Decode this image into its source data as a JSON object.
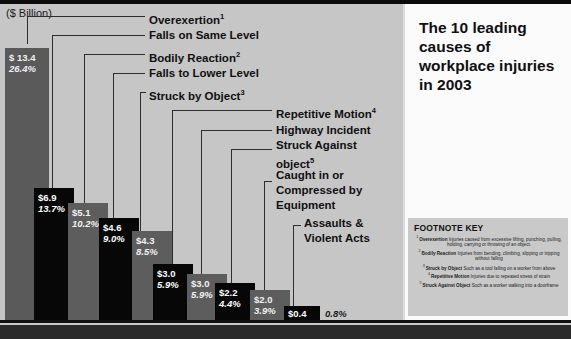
{
  "header": {
    "title": "The 10 leading causes of workplace injuries in 2003",
    "axis_unit": "($ Billion)"
  },
  "chart_data": {
    "type": "bar",
    "title": "The 10 leading causes of workplace injuries in 2003",
    "xlabel": "",
    "ylabel": "($ Billion)",
    "ylim": [
      0,
      13.4
    ],
    "grid": false,
    "legend": "none",
    "categories": [
      "Overexertion",
      "Falls on Same Level",
      "Bodily Reaction",
      "Falls to Lower Level",
      "Struck by Object",
      "Repetitive Motion",
      "Highway Incident",
      "Struck Against object",
      "Caught in or Compressed by Equipment",
      "Assaults & Violent Acts"
    ],
    "values": [
      13.4,
      6.9,
      5.1,
      4.6,
      4.3,
      3.0,
      3.0,
      2.2,
      2.0,
      0.4
    ],
    "value_labels": [
      "$ 13.4",
      "$6.9",
      "$5.1",
      "$4.6",
      "$4.3",
      "$3.0",
      "$3.0",
      "$2.2",
      "$2.0",
      "$0.4"
    ],
    "percents": [
      26.4,
      13.7,
      10.2,
      9.0,
      8.5,
      5.9,
      5.9,
      4.4,
      3.9,
      0.8
    ],
    "percent_labels": [
      "26.4%",
      "13.7%",
      "10.2%",
      "9.0%",
      "8.5%",
      "5.9%",
      "5.9%",
      "4.4%",
      "3.9%",
      "0.8%"
    ],
    "footnote_markers": [
      "1",
      "",
      "2",
      "",
      "3",
      "4",
      "",
      "5",
      "",
      ""
    ]
  },
  "bars": [
    {
      "value_label": "$ 13.4",
      "percent_label": "26.4%",
      "category": "Overexertion",
      "marker": "1"
    },
    {
      "value_label": "$6.9",
      "percent_label": "13.7%",
      "category": "Falls on Same Level",
      "marker": ""
    },
    {
      "value_label": "$5.1",
      "percent_label": "10.2%",
      "category": "Bodily Reaction",
      "marker": "2"
    },
    {
      "value_label": "$4.6",
      "percent_label": "9.0%",
      "category": "Falls to Lower Level",
      "marker": ""
    },
    {
      "value_label": "$4.3",
      "percent_label": "8.5%",
      "category": "Struck by Object",
      "marker": "3"
    },
    {
      "value_label": "$3.0",
      "percent_label": "5.9%",
      "category": "Repetitive Motion",
      "marker": "4"
    },
    {
      "value_label": "$3.0",
      "percent_label": "5.9%",
      "category": "Highway Incident",
      "marker": ""
    },
    {
      "value_label": "$2.2",
      "percent_label": "4.4%",
      "category": "Struck Against object",
      "marker": "5"
    },
    {
      "value_label": "$2.0",
      "percent_label": "3.9%",
      "category": "Caught in or Compressed by Equipment",
      "marker": ""
    },
    {
      "value_label": "$0.4",
      "percent_label": "0.8%",
      "category": "Assaults & Violent Acts",
      "marker": ""
    }
  ],
  "labels": {
    "overexertion": "Overexertion",
    "overexertion_sup": "1",
    "falls_same_level": "Falls on Same Level",
    "bodily_reaction": "Bodily Reaction",
    "bodily_reaction_sup": "2",
    "falls_lower_level": "Falls to Lower Level",
    "struck_by_object": "Struck by Object",
    "struck_by_object_sup": "3",
    "repetitive_motion": "Repetitive Motion",
    "repetitive_motion_sup": "4",
    "highway_incident": "Highway Incident",
    "struck_against_object": "Struck Against object",
    "struck_against_object_sup": "5",
    "caught_in": "Caught in or Compressed by Equipment",
    "assaults": "Assaults & Violent Acts"
  },
  "footnotes": {
    "heading": "FOOTNOTE KEY",
    "items": [
      {
        "num": "1",
        "term": "Overexertion",
        "text": "Injuries caused from excessive lifting, punching, pulling, holding, carrying or throwing of an object."
      },
      {
        "num": "2",
        "term": "Bodily Reaction",
        "text": "Injuries from bending, climbing, slipping or tripping without falling"
      },
      {
        "num": "3",
        "term": "Struck by Object",
        "text": "Such as a tool falling on a worker from above"
      },
      {
        "num": "4",
        "term": "Repetitive Motion",
        "text": "Injuries due to repeated stress of strain"
      },
      {
        "num": "5",
        "term": "Struck Against Object",
        "text": "Such as a worker walking into a doorframe"
      }
    ]
  },
  "colors": {
    "bar_dark": "#070707",
    "bar_gray": "#5d5d5d",
    "panel_bg": "#c6c6c6",
    "right_bg": "#fbfbfb",
    "rule": "#0b0b0b"
  }
}
